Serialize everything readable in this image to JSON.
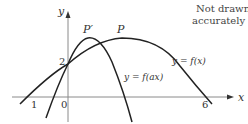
{
  "diagram": {
    "note_line1": "Not drawn",
    "note_line2": "accurately",
    "axes": {
      "x_label": "x",
      "y_label": "y",
      "origin_label": "0",
      "y_intercept_label": "2",
      "x_tick_left_label": "1",
      "x_tick_right_label": "6"
    },
    "curves": [
      {
        "name": "f",
        "label": "y = f(x)",
        "peak_label": "P"
      },
      {
        "name": "f_ax",
        "label": "y = f(ax)",
        "peak_label": "P′"
      }
    ],
    "colors": {
      "curve": "#222222",
      "axis": "#888888",
      "text": "#333333"
    }
  }
}
